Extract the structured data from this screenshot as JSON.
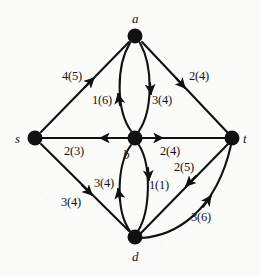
{
  "figure": {
    "label_format": "flow(capacity)",
    "ink_color": "#111111",
    "background_color": "#fbfbfa"
  },
  "nodes": [
    {
      "id": "a",
      "label": "a",
      "x": 135,
      "y": 36,
      "label_x": 132,
      "label_y": 12
    },
    {
      "id": "s",
      "label": "s",
      "x": 35,
      "y": 138,
      "label_x": 15,
      "label_y": 132
    },
    {
      "id": "b",
      "label": "b",
      "x": 135,
      "y": 138,
      "label_x": 123,
      "label_y": 148
    },
    {
      "id": "t",
      "label": "t",
      "x": 232,
      "y": 138,
      "label_x": 243,
      "label_y": 132
    },
    {
      "id": "d",
      "label": "d",
      "x": 135,
      "y": 237,
      "label_x": 132,
      "label_y": 250
    }
  ],
  "edges": [
    {
      "id": "s-a",
      "from": "s",
      "to": "a",
      "flow": 4,
      "capacity": 5,
      "label": "4(5)",
      "label_x": 62,
      "label_y": 70
    },
    {
      "id": "a-t",
      "from": "a",
      "to": "t",
      "flow": 2,
      "capacity": 4,
      "label": "2(4)",
      "label_x": 189,
      "label_y": 70
    },
    {
      "id": "b-a",
      "from": "b",
      "to": "a",
      "flow": 1,
      "capacity": 6,
      "label": "1(6)",
      "label_x": 92,
      "label_y": 94
    },
    {
      "id": "a-b",
      "from": "a",
      "to": "b",
      "flow": 3,
      "capacity": 4,
      "label": "3(4)",
      "label_x": 152,
      "label_y": 94
    },
    {
      "id": "b-s",
      "from": "b",
      "to": "s",
      "flow": 2,
      "capacity": 3,
      "label": "2(3)",
      "label_x": 64,
      "label_y": 145
    },
    {
      "id": "b-t",
      "from": "b",
      "to": "t",
      "flow": 2,
      "capacity": 4,
      "label": "2(4)",
      "label_x": 160,
      "label_y": 145
    },
    {
      "id": "s-d",
      "from": "s",
      "to": "d",
      "flow": 3,
      "capacity": 4,
      "label": "3(4)",
      "label_x": 61,
      "label_y": 196
    },
    {
      "id": "d-b",
      "from": "d",
      "to": "b",
      "flow": 3,
      "capacity": 4,
      "label": "3(4)",
      "label_x": 94,
      "label_y": 177
    },
    {
      "id": "b-d",
      "from": "b",
      "to": "d",
      "flow": 1,
      "capacity": 1,
      "label": "1(1)",
      "label_x": 149,
      "label_y": 179
    },
    {
      "id": "t-d",
      "from": "t",
      "to": "d",
      "flow": 2,
      "capacity": 5,
      "label": "2(5)",
      "label_x": 174,
      "label_y": 161
    },
    {
      "id": "d-t",
      "from": "d",
      "to": "t",
      "flow": 3,
      "capacity": 6,
      "label": "3(6)",
      "label_x": 191,
      "label_y": 211
    }
  ]
}
